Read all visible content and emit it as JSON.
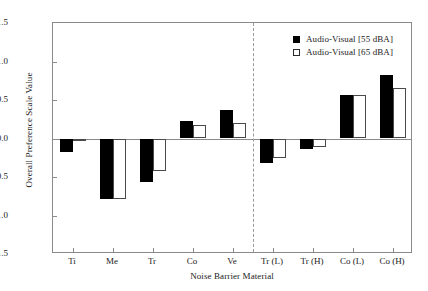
{
  "chart_data": {
    "type": "bar",
    "title": "",
    "xlabel": "Noise Barrier Material",
    "ylabel": "Overall Preference Scale Value",
    "categories": [
      "Ti",
      "Me",
      "Tr",
      "Co",
      "Ve",
      "Tr (L)",
      "Tr (H)",
      "Co (L)",
      "Co (H)"
    ],
    "series": [
      {
        "name": "Audio-Visual [55 dBA]",
        "style": "filled",
        "color": "#000000",
        "values": [
          -0.18,
          -0.79,
          -0.57,
          0.23,
          0.37,
          -0.32,
          -0.13,
          0.56,
          0.82
        ]
      },
      {
        "name": "Audio-Visual [65 dBA]",
        "style": "open",
        "color": "#ffffff",
        "values": [
          -0.02,
          -0.78,
          -0.42,
          0.18,
          0.2,
          -0.25,
          -0.11,
          0.56,
          0.65
        ]
      }
    ],
    "ylim": [
      -1.5,
      1.5
    ],
    "yticks": [
      1.5,
      1.0,
      0.5,
      0.0,
      -0.5,
      -1.0,
      -1.5
    ],
    "ytick_labels": [
      "1.5",
      "1.0",
      "0.5",
      "0.0",
      "−0.5",
      "−1.0",
      "−1.5"
    ],
    "grid": false,
    "legend_position": "top-right",
    "zero_line": true,
    "divider_after_category_index": 4
  },
  "legend": {
    "entries": [
      {
        "label": "Audio-Visual [55 dBA]",
        "style": "filled"
      },
      {
        "label": "Audio-Visual [65 dBA]",
        "style": "open"
      }
    ]
  }
}
